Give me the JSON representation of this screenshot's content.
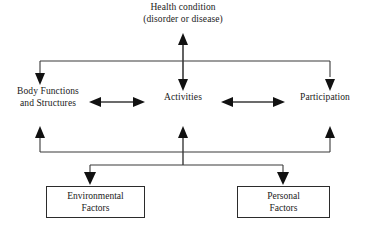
{
  "diagram": {
    "type": "flow-diagram",
    "canvas": {
      "width": 366,
      "height": 226
    },
    "line_color": "#3a3a3a",
    "arrow_color": "#111111",
    "background_color": "#ffffff",
    "box_border_color": "#2b2b2b"
  },
  "nodes": {
    "health_condition": {
      "line1": "Health condition",
      "line2": "(disorder or disease)",
      "boxed": "no"
    },
    "body_functions": {
      "line1": "Body Functions",
      "line2": "and Structures",
      "boxed": "no"
    },
    "activities": {
      "line1": "Activities",
      "boxed": "no"
    },
    "participation": {
      "line1": "Participation",
      "boxed": "no"
    },
    "environmental_factors": {
      "line1": "Environmental",
      "line2": "Factors",
      "boxed": "yes"
    },
    "personal_factors": {
      "line1": "Personal",
      "line2": "Factors",
      "boxed": "yes"
    }
  },
  "connectors": [
    {
      "name": "health-condition-to-activities",
      "style": "double-headed-vertical"
    },
    {
      "name": "top-bus-to-body-functions",
      "style": "single-headed-down"
    },
    {
      "name": "top-bus-to-activities",
      "style": "single-headed-down"
    },
    {
      "name": "top-bus-to-participation",
      "style": "single-headed-down"
    },
    {
      "name": "body-functions-to-activities",
      "style": "double-headed-horizontal"
    },
    {
      "name": "activities-to-participation",
      "style": "double-headed-horizontal"
    },
    {
      "name": "bottom-bus-to-body-functions",
      "style": "single-headed-up"
    },
    {
      "name": "bottom-bus-to-activities",
      "style": "single-headed-up"
    },
    {
      "name": "bottom-bus-to-participation",
      "style": "single-headed-up"
    },
    {
      "name": "factor-bus-to-environmental-factors",
      "style": "single-headed-down"
    },
    {
      "name": "factor-bus-to-personal-factors",
      "style": "single-headed-down"
    }
  ]
}
